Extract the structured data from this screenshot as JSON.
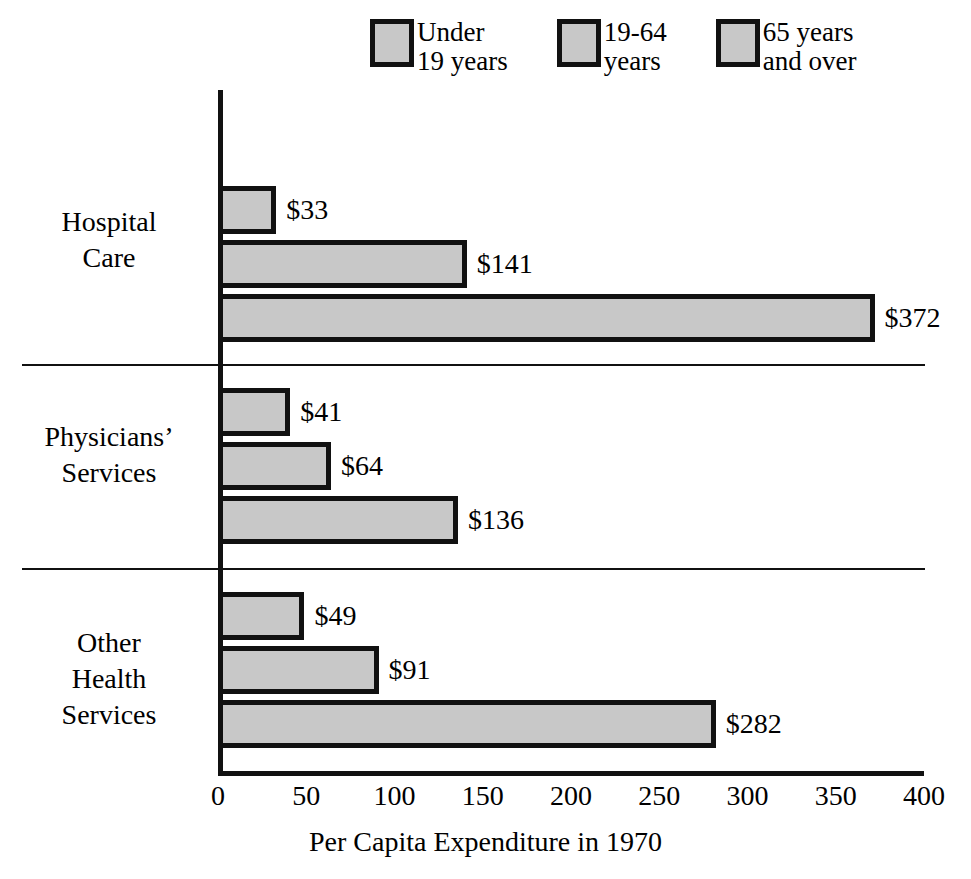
{
  "chart_data": {
    "type": "bar",
    "orientation": "horizontal",
    "title": "",
    "xlabel": "Per Capita Expenditure in 1970",
    "ylabel": "",
    "xlim": [
      0,
      400
    ],
    "xticks": [
      0,
      50,
      100,
      150,
      200,
      250,
      300,
      350,
      400
    ],
    "xtick_labels": [
      "0",
      "50",
      "100",
      "150",
      "200",
      "250",
      "300",
      "350",
      "400"
    ],
    "grid": false,
    "legend_position": "top",
    "categories": [
      "Hospital\nCare",
      "Physicians’\nServices",
      "Other\nHealth\nServices"
    ],
    "series": [
      {
        "name": "Under\n19 years",
        "values": [
          33,
          41,
          49
        ],
        "value_labels": [
          "$33",
          "$41",
          "$49"
        ],
        "color": "#c8c8c8"
      },
      {
        "name": "19-64\nyears",
        "values": [
          141,
          64,
          91
        ],
        "value_labels": [
          "$141",
          "$64",
          "$91"
        ],
        "color": "#c8c8c8"
      },
      {
        "name": "65 years\nand over",
        "values": [
          372,
          136,
          282
        ],
        "value_labels": [
          "$372",
          "$136",
          "$282"
        ],
        "color": "#c8c8c8"
      }
    ]
  },
  "legend": {
    "items": [
      {
        "label": "Under\n19 years"
      },
      {
        "label": "19-64\nyears"
      },
      {
        "label": "65 years\nand over"
      }
    ]
  },
  "axis": {
    "x_title": "Per Capita Expenditure in 1970",
    "ticks": [
      "0",
      "50",
      "100",
      "150",
      "200",
      "250",
      "300",
      "350",
      "400"
    ]
  },
  "categories": [
    {
      "label": "Hospital\nCare"
    },
    {
      "label": "Physicians’\nServices"
    },
    {
      "label": "Other\nHealth\nServices"
    }
  ],
  "bars": [
    {
      "value_label": "$33",
      "series": "Under 19 years",
      "category": "Hospital Care"
    },
    {
      "value_label": "$141",
      "series": "19-64 years",
      "category": "Hospital Care"
    },
    {
      "value_label": "$372",
      "series": "65 years and over",
      "category": "Hospital Care"
    },
    {
      "value_label": "$41",
      "series": "Under 19 years",
      "category": "Physicians' Services"
    },
    {
      "value_label": "$64",
      "series": "19-64 years",
      "category": "Physicians' Services"
    },
    {
      "value_label": "$136",
      "series": "65 years and over",
      "category": "Physicians' Services"
    },
    {
      "value_label": "$49",
      "series": "Under 19 years",
      "category": "Other Health Services"
    },
    {
      "value_label": "$91",
      "series": "19-64 years",
      "category": "Other Health Services"
    },
    {
      "value_label": "$282",
      "series": "65 years and over",
      "category": "Other Health Services"
    }
  ],
  "colors": {
    "bar_fill": "#c8c8c8",
    "bar_border": "#111111",
    "axis": "#111111",
    "text": "#000000"
  }
}
